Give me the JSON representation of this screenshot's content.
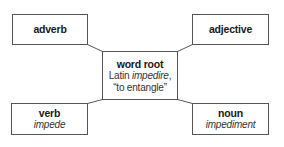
{
  "diagram": {
    "center": {
      "label": "word root",
      "line1_prefix": "Latin ",
      "line1_italic": "impedire",
      "line1_suffix": ",",
      "line2": "“to entangle”"
    },
    "nodes": [
      {
        "id": "adverb",
        "label": "adverb",
        "example": ""
      },
      {
        "id": "adjective",
        "label": "adjective",
        "example": ""
      },
      {
        "id": "verb",
        "label": "verb",
        "example": "impede"
      },
      {
        "id": "noun",
        "label": "noun",
        "example": "impediment"
      }
    ],
    "edges": [
      {
        "from": "word root",
        "to": "adverb"
      },
      {
        "from": "word root",
        "to": "adjective"
      },
      {
        "from": "word root",
        "to": "verb"
      },
      {
        "from": "word root",
        "to": "noun"
      }
    ],
    "colors": {
      "border": "#555555",
      "line": "#555555",
      "text": "#1a1a1a",
      "background": "#ffffff"
    }
  }
}
